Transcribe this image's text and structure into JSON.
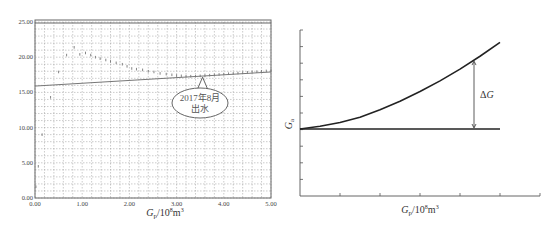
{
  "chart_data": [
    {
      "type": "scatter",
      "title": "",
      "xlabel": "Gp/10^8m^3",
      "xlabel_parts": {
        "main": "G",
        "sub": "p",
        "unit_prefix": "/10",
        "exp": "8",
        "unit": "m",
        "unit_exp": "3"
      },
      "ylabel": "",
      "xlim": [
        0,
        5
      ],
      "ylim": [
        0,
        25
      ],
      "grid": true,
      "x_ticks": [
        "0.00",
        "1.00",
        "2.00",
        "3.00",
        "4.00",
        "5.00"
      ],
      "y_ticks": [
        "0.00",
        "5.00",
        "10.00",
        "15.00",
        "20.00",
        "25.00"
      ],
      "series": [
        {
          "name": "observed points",
          "type": "scatter",
          "points": [
            [
              0.02,
              1.6
            ],
            [
              0.07,
              4.5
            ],
            [
              0.15,
              9.0
            ],
            [
              0.33,
              14.3
            ],
            [
              0.5,
              17.9
            ],
            [
              0.67,
              20.3
            ],
            [
              0.83,
              21.4
            ],
            [
              0.95,
              20.4
            ],
            [
              1.07,
              20.6
            ],
            [
              1.18,
              20.3
            ],
            [
              1.28,
              20.0
            ],
            [
              1.38,
              19.8
            ],
            [
              1.5,
              19.6
            ],
            [
              1.6,
              19.4
            ],
            [
              1.72,
              19.2
            ],
            [
              1.85,
              19.0
            ],
            [
              1.95,
              18.7
            ],
            [
              2.05,
              18.4
            ],
            [
              2.15,
              18.3
            ],
            [
              2.28,
              18.2
            ],
            [
              2.4,
              18.0
            ],
            [
              2.52,
              17.9
            ],
            [
              2.65,
              17.7
            ],
            [
              2.78,
              17.6
            ],
            [
              2.9,
              17.5
            ],
            [
              3.0,
              17.4
            ],
            [
              3.1,
              17.35
            ],
            [
              3.2,
              17.3
            ],
            [
              3.3,
              17.3
            ],
            [
              3.4,
              17.3
            ],
            [
              3.5,
              17.35
            ],
            [
              3.6,
              17.4
            ],
            [
              3.7,
              17.45
            ],
            [
              3.8,
              17.5
            ],
            [
              3.9,
              17.55
            ],
            [
              4.0,
              17.6
            ],
            [
              4.1,
              17.65
            ],
            [
              4.2,
              17.7
            ],
            [
              4.3,
              17.75
            ],
            [
              4.4,
              17.8
            ],
            [
              4.5,
              17.85
            ],
            [
              4.6,
              17.9
            ],
            [
              4.7,
              17.95
            ],
            [
              4.8,
              18.0
            ],
            [
              4.9,
              18.05
            ],
            [
              5.0,
              18.1
            ]
          ]
        },
        {
          "name": "trend line",
          "type": "line",
          "x": [
            0,
            5
          ],
          "y": [
            15.9,
            17.9
          ]
        },
        {
          "name": "top border line",
          "type": "line",
          "x": [
            0,
            5
          ],
          "y": [
            25,
            25
          ]
        }
      ],
      "annotations": [
        {
          "text_line1": "2017年8月",
          "text_line2": "出水",
          "shape": "callout-ellipse",
          "points_to": [
            3.55,
            17.3
          ]
        }
      ]
    },
    {
      "type": "line",
      "title": "",
      "xlabel": "Gp/10^8m^3",
      "xlabel_parts": {
        "main": "G",
        "sub": "p",
        "unit_prefix": "/10",
        "exp": "8",
        "unit": "m",
        "unit_exp": "3"
      },
      "ylabel": "Ga",
      "ylabel_parts": {
        "main": "G",
        "sub": "a"
      },
      "grid": false,
      "x_ticks_count": 6,
      "y_ticks_count": 10,
      "series": [
        {
          "name": "curve",
          "x": [
            0,
            0.1,
            0.2,
            0.3,
            0.4,
            0.5,
            0.6,
            0.7,
            0.8,
            0.9,
            1.0
          ],
          "y": [
            0,
            0.05,
            0.12,
            0.22,
            0.36,
            0.52,
            0.7,
            0.9,
            1.12,
            1.36,
            1.62
          ]
        },
        {
          "name": "baseline",
          "x": [
            0,
            1.0
          ],
          "y": [
            0,
            0
          ]
        }
      ],
      "annotations": [
        {
          "text": "ΔG",
          "type": "double-arrow",
          "at_x": 0.87
        }
      ]
    }
  ]
}
